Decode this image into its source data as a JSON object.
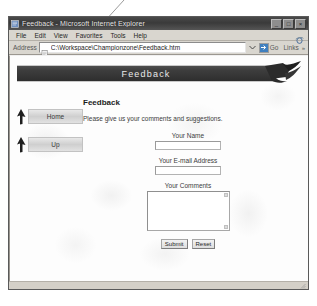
{
  "browser": {
    "window_title": "Feedback - Microsoft Internet Explorer",
    "title_icon": "ie-document-icon",
    "window_controls": [
      {
        "name": "minimize",
        "glyph": "_"
      },
      {
        "name": "maximize",
        "glyph": "□"
      },
      {
        "name": "close",
        "glyph": "×"
      }
    ],
    "menu": [
      {
        "label": "File"
      },
      {
        "label": "Edit"
      },
      {
        "label": "View"
      },
      {
        "label": "Favorites"
      },
      {
        "label": "Tools"
      },
      {
        "label": "Help"
      }
    ],
    "menu_logo_icon": "ie-logo-icon",
    "address": {
      "label": "Address",
      "value": "C:\\Workspace\\Championzone\\Feedback.htm",
      "placeholder": "",
      "page_icon": "page-document-icon",
      "dropdown_icon": "chevron-down-icon",
      "go_label": "Go",
      "go_icon": "go-arrow-icon",
      "links_label": "Links",
      "overflow_icon": "chevron-right-icon"
    }
  },
  "page": {
    "banner": {
      "title": "Feedback",
      "swoosh_icon": "swoosh-graphic"
    },
    "nav": [
      {
        "label": "Home",
        "icon": "up-arrow-icon"
      },
      {
        "label": "Up",
        "icon": "up-arrow-icon"
      }
    ],
    "heading": "Feedback",
    "intro": "Please give us your comments and suggestions.",
    "form": {
      "fields": [
        {
          "label": "Your Name",
          "value": "",
          "placeholder": ""
        },
        {
          "label": "Your E-mail Address",
          "value": "",
          "placeholder": ""
        }
      ],
      "comments": {
        "label": "Your Comments",
        "value": "",
        "placeholder": ""
      },
      "buttons": [
        {
          "label": "Submit"
        },
        {
          "label": "Reset"
        }
      ]
    }
  },
  "colors": {
    "banner_bg": "#2e2e2e",
    "title_bar": "#3a3a3a",
    "chrome": "#d9d6cf",
    "page_bg": "#fdfdfd",
    "go_blue": "#3f7fbf"
  }
}
